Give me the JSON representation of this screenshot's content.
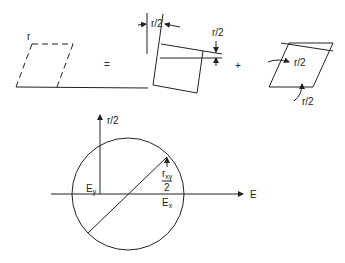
{
  "diagram": {
    "top_row": {
      "left_shape_label": "r",
      "equals_sign": "=",
      "plus_sign": "+",
      "square_top_label": "r/2",
      "square_right_label": "r/2",
      "rhombus_label_upper": "r/2",
      "rhombus_label_lower": "r/2"
    },
    "mohr_circle": {
      "vertical_axis_label": "r/2",
      "horizontal_axis_label": "E",
      "left_point_label": "E",
      "left_point_sub": "y",
      "right_point_label": "E",
      "right_point_sub": "x",
      "shear_label_num": "r",
      "shear_label_sub": "xy",
      "shear_label_den": "2"
    },
    "colors": {
      "stroke": "#222222",
      "background": "#ffffff"
    }
  }
}
